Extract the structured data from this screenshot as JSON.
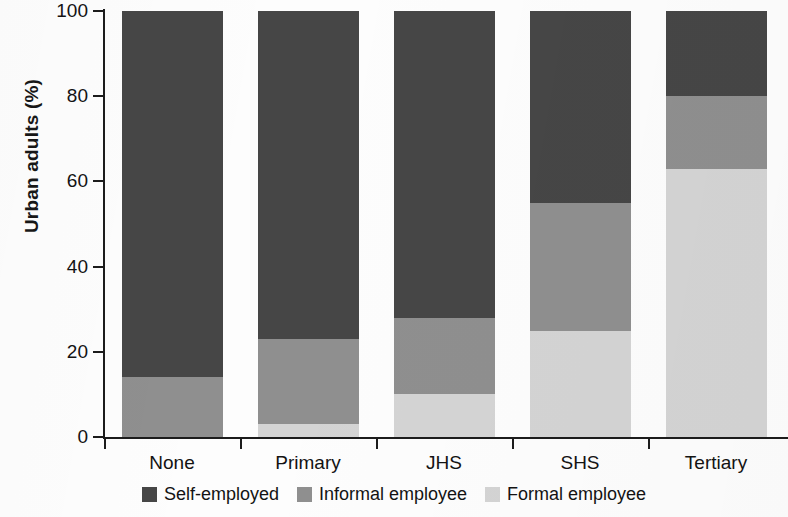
{
  "chart_data": {
    "type": "bar",
    "subtype": "stacked-bar-100",
    "title": "",
    "xlabel": "",
    "ylabel": "Urban adults (%)",
    "ylim": [
      0,
      100
    ],
    "yticks": [
      0,
      20,
      40,
      60,
      80,
      100
    ],
    "ytick_labels": [
      "0",
      "20",
      "40",
      "60",
      "80",
      "100"
    ],
    "grid": false,
    "legend_position": "bottom",
    "categories": [
      "None",
      "Primary",
      "JHS",
      "SHS",
      "Tertiary"
    ],
    "series": [
      {
        "name": "Formal employee",
        "color": "#d4d4d4",
        "values": [
          0,
          3,
          10,
          25,
          63
        ]
      },
      {
        "name": "Informal employee",
        "color": "#8f8f8f",
        "values": [
          14,
          20,
          18,
          30,
          17
        ]
      },
      {
        "name": "Self-employed",
        "color": "#464646",
        "values": [
          86,
          77,
          72,
          45,
          20
        ]
      }
    ],
    "legend": [
      {
        "label": "Self-employed",
        "color": "#464646"
      },
      {
        "label": "Informal employee",
        "color": "#8f8f8f"
      },
      {
        "label": "Formal employee",
        "color": "#d4d4d4"
      }
    ],
    "colors": {
      "self_employed": "#464646",
      "informal_employee": "#8f8f8f",
      "formal_employee": "#d4d4d4",
      "axis": "#1c1c1c",
      "background": "#fdfdfd"
    }
  }
}
